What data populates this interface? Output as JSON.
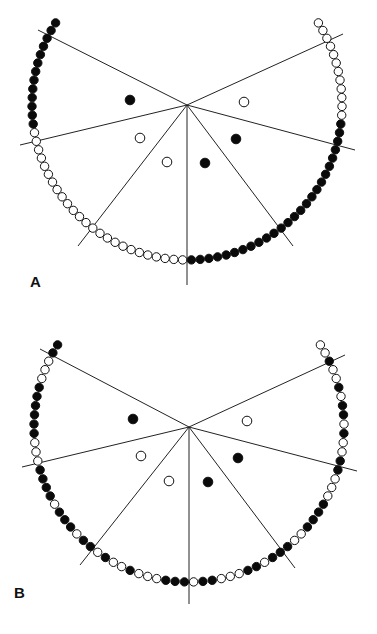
{
  "panels": [
    {
      "label": "A",
      "label_pos": [
        30,
        287
      ],
      "center": [
        187,
        105
      ],
      "radius": 155,
      "spokes": [
        [
          38,
          30
        ],
        [
          20,
          145
        ],
        [
          78,
          246
        ],
        [
          187,
          285
        ],
        [
          293,
          246
        ],
        [
          355,
          150
        ],
        [
          343,
          34
        ]
      ],
      "inner_dots": [
        {
          "x": 130,
          "y": 100,
          "filled": true
        },
        {
          "x": 244,
          "y": 102,
          "filled": false
        },
        {
          "x": 140,
          "y": 138,
          "filled": false
        },
        {
          "x": 167,
          "y": 162,
          "filled": false
        },
        {
          "x": 205,
          "y": 163,
          "filled": true
        },
        {
          "x": 236,
          "y": 139,
          "filled": true
        }
      ],
      "arc_start_deg": 210,
      "arc_end_deg": 330,
      "arc_pattern": "FFFFFFFFFFFFFOOOOOOOOOOOOOOOOOOOOOOOOOFFFFFFFFFFFFFFFFFFFFFFFFFFOOOOOOOOOOOO"
    },
    {
      "label": "B",
      "label_pos": [
        14,
        598
      ],
      "center": [
        189,
        427
      ],
      "radius": 155,
      "spokes": [
        [
          40,
          349
        ],
        [
          22,
          467
        ],
        [
          80,
          565
        ],
        [
          189,
          604
        ],
        [
          295,
          568
        ],
        [
          357,
          471
        ],
        [
          345,
          355
        ]
      ],
      "inner_dots": [
        {
          "x": 133,
          "y": 419,
          "filled": true
        },
        {
          "x": 247,
          "y": 421,
          "filled": false
        },
        {
          "x": 141,
          "y": 456,
          "filled": false
        },
        {
          "x": 169,
          "y": 481,
          "filled": false
        },
        {
          "x": 208,
          "y": 482,
          "filled": true
        },
        {
          "x": 238,
          "y": 458,
          "filled": true
        }
      ],
      "arc_start_deg": 210,
      "arc_end_deg": 330,
      "arc_pattern": "FFOOOFFFFFFOOOFFFFOFFFOFFOFOOFOOOFFFOFFOOOFFOFFFOOFFFFOOOFFOOFOFFOFOOFOO"
    }
  ],
  "style": {
    "line_color": "#222222",
    "dot_fill": "#0a0a0a",
    "dot_open": "#ffffff",
    "dot_stroke": "#111111",
    "dot_radius": 4.2
  }
}
